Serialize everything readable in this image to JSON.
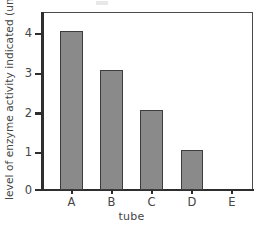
{
  "chart_data": {
    "type": "bar",
    "title": "",
    "xlabel": "tube",
    "ylabel": "level of enzyme activity indicated (units)",
    "categories": [
      "A",
      "B",
      "C",
      "D",
      "E"
    ],
    "values": [
      4,
      3,
      2,
      1,
      0
    ],
    "ylim": [
      0,
      4.6
    ],
    "yticks": [
      0,
      1,
      2,
      3,
      4
    ],
    "ytick_labels": [
      "0",
      "1",
      "2",
      "3",
      "4"
    ],
    "grid": false,
    "legend": null,
    "bar_fill_color": "#8a8a8a",
    "bar_edge_color": "#3d3d3d",
    "axis_color": "#2e2e2e",
    "background_color": "#ffffff"
  },
  "axes": {
    "y_title": "level of enzyme activity indicated (units)",
    "x_title": "tube"
  },
  "y_ticks": [
    {
      "label": "4"
    },
    {
      "label": "3"
    },
    {
      "label": "2"
    },
    {
      "label": "1"
    },
    {
      "label": "0"
    }
  ],
  "x_ticks": [
    {
      "label": "A"
    },
    {
      "label": "B"
    },
    {
      "label": "C"
    },
    {
      "label": "D"
    },
    {
      "label": "E"
    }
  ]
}
